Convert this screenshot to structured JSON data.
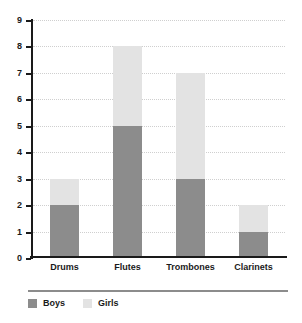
{
  "chart_data": {
    "type": "bar",
    "stacked": true,
    "title": "",
    "subtitle": "",
    "xlabel": "",
    "ylabel": "",
    "categories": [
      "Drums",
      "Flutes",
      "Trombones",
      "Clarinets"
    ],
    "series": [
      {
        "name": "Boys",
        "values": [
          2,
          5,
          3,
          1
        ],
        "color": "#8c8c8c"
      },
      {
        "name": "Girls",
        "values": [
          1,
          3,
          4,
          1
        ],
        "color": "#e3e3e3"
      }
    ],
    "totals": [
      3,
      8,
      7,
      2
    ],
    "ylim": [
      0,
      9
    ],
    "ytick_labels": [
      "0",
      "1",
      "2",
      "3",
      "4",
      "5",
      "6",
      "7",
      "8",
      "9"
    ],
    "ytick_values": [
      0,
      1,
      2,
      3,
      4,
      5,
      6,
      7,
      8,
      9
    ],
    "grid": true,
    "grid_style": "dotted",
    "grid_color": "#cfcfcf",
    "legend_position": "bottom-left",
    "axis_color": "#1a1a1a",
    "background": "#ffffff"
  },
  "legend": {
    "items": [
      {
        "label": "Boys",
        "swatch_name": "legend-swatch-boys"
      },
      {
        "label": "Girls",
        "swatch_name": "legend-swatch-girls"
      }
    ]
  }
}
